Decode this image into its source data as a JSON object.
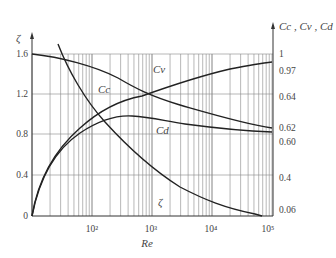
{
  "chart_data": {
    "type": "line",
    "title": "",
    "xlabel": "Re",
    "xscale": "log",
    "xlim": [
      10,
      100000
    ],
    "x_ticks": [
      "10²",
      "10³",
      "10⁴",
      "10⁵"
    ],
    "ylabel_left": "ζ",
    "ylim_left": [
      0,
      1.6
    ],
    "y_ticks_left": [
      "0",
      "0.4",
      "0.8",
      "1.2",
      "1.6"
    ],
    "ylabel_right": "Cc , Cv , Cd",
    "y_ticks_right": [
      "1",
      "0.97",
      "0.64",
      "0.62",
      "0.60",
      "0.4",
      "0.06"
    ],
    "grid": true,
    "series": [
      {
        "name": "Cc",
        "label": "Cc",
        "x": [
          10,
          30,
          100,
          300,
          1000,
          3000,
          10000,
          100000
        ],
        "values": [
          1.6,
          1.54,
          1.42,
          1.28,
          1.18,
          1.1,
          1.02,
          0.88
        ]
      },
      {
        "name": "Cv",
        "label": "Cv",
        "x": [
          10,
          15,
          30,
          100,
          300,
          1000,
          10000,
          100000
        ],
        "values": [
          0,
          0.45,
          0.72,
          0.96,
          1.12,
          1.22,
          1.38,
          1.52
        ]
      },
      {
        "name": "Cd",
        "label": "Cd",
        "x": [
          10,
          20,
          40,
          100,
          300,
          1000,
          10000,
          100000
        ],
        "values": [
          0,
          0.5,
          0.75,
          0.94,
          0.99,
          0.96,
          0.88,
          0.83
        ]
      },
      {
        "name": "ζ",
        "label": "ζ",
        "x": [
          25,
          40,
          100,
          300,
          1000,
          10000,
          40000
        ],
        "values": [
          1.6,
          1.45,
          0.98,
          0.62,
          0.38,
          0.12,
          0.0
        ]
      }
    ],
    "labels": {
      "zeta_axis": "ζ",
      "right_axis": "Cc , Cv , Cd",
      "re": "Re",
      "cc": "Cc",
      "cv": "Cv",
      "cd": "Cd",
      "zeta_curve": "ζ"
    }
  }
}
